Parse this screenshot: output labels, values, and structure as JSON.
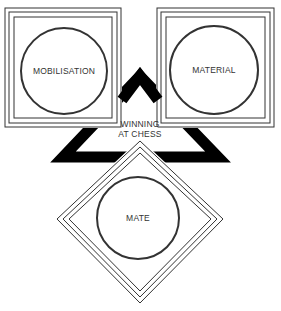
{
  "diagram": {
    "center_label": {
      "line1": "WINNING",
      "line2": "AT CHESS"
    },
    "nodes": [
      {
        "id": "mobilisation",
        "label": "MOBILISATION",
        "shape": "square-with-circle",
        "position": "top-left"
      },
      {
        "id": "material",
        "label": "MATERIAL",
        "shape": "square-with-circle",
        "position": "top-right"
      },
      {
        "id": "mate",
        "label": "MATE",
        "shape": "diamond-with-circle",
        "position": "bottom"
      }
    ],
    "colors": {
      "line": "#333333",
      "triangle": "#000000",
      "background": "#ffffff"
    }
  }
}
